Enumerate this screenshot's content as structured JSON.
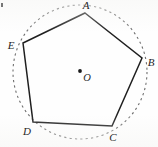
{
  "figure": {
    "kind": "geometry-diagram",
    "canvas": {
      "width": 158,
      "height": 147,
      "background": "#fefefe"
    },
    "colors": {
      "polygon_stroke": "#1f1f1f",
      "circle_stroke": "#6e6e6e",
      "label_text": "#262626",
      "center_dot": "#1a1a1a"
    },
    "circle": {
      "name": "circumscribed-circle",
      "center_x": 80,
      "center_y": 72,
      "radius": 67,
      "stroke_width": 1.1,
      "dash_pattern": "2.2 3.2",
      "style": "dashed"
    },
    "center_point": {
      "label": "O",
      "x": 80,
      "y": 71,
      "dot_radius": 1.9,
      "label_x": 87,
      "label_y": 78
    },
    "polygon": {
      "name": "pentagon-ABCDE",
      "sides": 5,
      "stroke_width": 1.5,
      "fill": "none",
      "points": "85,13 142,58 112,126 33,122 23,43",
      "vertices": [
        {
          "id": "A",
          "label": "A",
          "x": 85,
          "y": 13,
          "label_x": 86,
          "label_y": 5
        },
        {
          "id": "B",
          "label": "B",
          "x": 142,
          "y": 58,
          "label_x": 151,
          "label_y": 62
        },
        {
          "id": "C",
          "label": "C",
          "x": 112,
          "y": 126,
          "label_x": 113,
          "label_y": 137
        },
        {
          "id": "D",
          "label": "D",
          "x": 33,
          "y": 122,
          "label_x": 27,
          "label_y": 131
        },
        {
          "id": "E",
          "label": "E",
          "x": 23,
          "y": 43,
          "label_x": 11,
          "label_y": 45
        }
      ],
      "edges": [
        {
          "from": "A",
          "to": "B"
        },
        {
          "from": "B",
          "to": "C"
        },
        {
          "from": "C",
          "to": "D"
        },
        {
          "from": "D",
          "to": "E"
        },
        {
          "from": "E",
          "to": "A"
        }
      ]
    },
    "artifacts": [
      {
        "name": "scan-speck",
        "x": 1,
        "y": 3,
        "width": 2,
        "height": 4
      }
    ]
  }
}
